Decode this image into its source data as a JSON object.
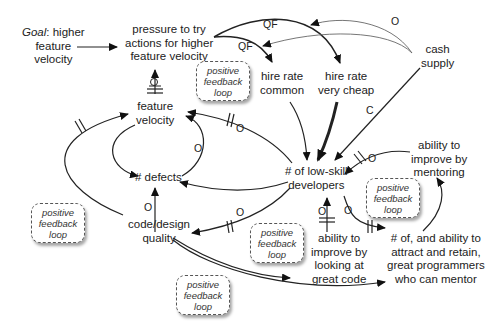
{
  "diagram": {
    "type": "causal-loop",
    "nodes": {
      "goal": {
        "prefix": "Goal",
        "line1_rest": ": higher",
        "line2": "feature",
        "line3": "velocity"
      },
      "pressure": {
        "line1": "pressure to try",
        "line2": "actions for higher",
        "line3": "feature velocity"
      },
      "hire_common": {
        "line1": "hire rate",
        "line2": "common"
      },
      "hire_cheap": {
        "line1": "hire rate",
        "line2": "very cheap"
      },
      "cash": {
        "line1": "cash",
        "line2": "supply"
      },
      "feature_velocity": {
        "line1": "feature",
        "line2": "velocity"
      },
      "defects": {
        "line1": "# defects"
      },
      "low_skill": {
        "line1": "# of low-skill",
        "line2": "developers"
      },
      "mentoring": {
        "line1": "ability to",
        "line2": "improve by",
        "line3": "mentoring"
      },
      "code_quality": {
        "line1": "code/design",
        "line2": "quality"
      },
      "looking": {
        "line1": "ability to",
        "line2": "improve by",
        "line3": "looking at",
        "line4": "great code"
      },
      "great_programmers": {
        "line1": "# of, and ability to",
        "line2": "attract and retain,",
        "line3": "great programmers",
        "line4": "who can mentor"
      }
    },
    "loops": [
      {
        "line1": "positive",
        "line2": "feedback",
        "line3": "loop"
      },
      {
        "line1": "positive",
        "line2": "feedback",
        "line3": "loop"
      },
      {
        "line1": "positive",
        "line2": "feedback",
        "line3": "loop"
      },
      {
        "line1": "positive",
        "line2": "feedback",
        "line3": "loop"
      },
      {
        "line1": "positive",
        "line2": "feedback",
        "line3": "loop"
      }
    ],
    "edge_labels": {
      "qf1": "QF",
      "qf2": "QF",
      "o_cash": "O",
      "c_cash": "C",
      "o": "O"
    }
  }
}
